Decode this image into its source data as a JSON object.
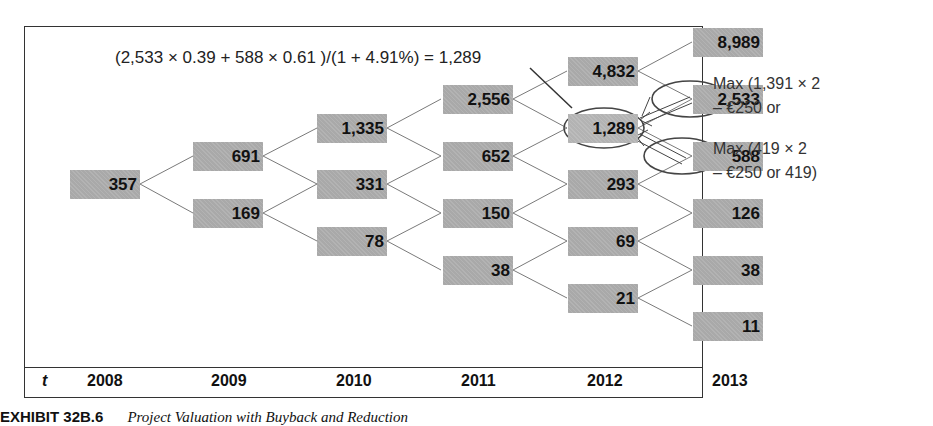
{
  "formula": "(2,533 × 0.39 + 588 × 0.61 )/(1 + 4.91%) = 1,289",
  "notes": {
    "upper": [
      "Max (1,391 × 2",
      "– €250 or"
    ],
    "lower": [
      "Max (419 × 2",
      "– €250 or 419)"
    ]
  },
  "axis": {
    "t_label": "t",
    "years": [
      "2008",
      "2009",
      "2010",
      "2011",
      "2012",
      "2013"
    ]
  },
  "tree": {
    "2008": [
      "357"
    ],
    "2009": [
      "691",
      "169"
    ],
    "2010": [
      "1,335",
      "331",
      "78"
    ],
    "2011": [
      "2,556",
      "652",
      "150",
      "38"
    ],
    "2012": [
      "4,832",
      "1,289",
      "293",
      "69",
      "21"
    ],
    "2013": [
      "8,989",
      "2,533",
      "588",
      "126",
      "38",
      "11"
    ]
  },
  "highlighted": [
    "1,289",
    "2,533",
    "588"
  ],
  "caption": {
    "label": "EXHIBIT 32B.6",
    "title": "Project Valuation with Buyback and Reduction"
  },
  "colors": {
    "node_fill": "#a9a9a9",
    "line": "#777777",
    "ellipse": "#444444"
  }
}
